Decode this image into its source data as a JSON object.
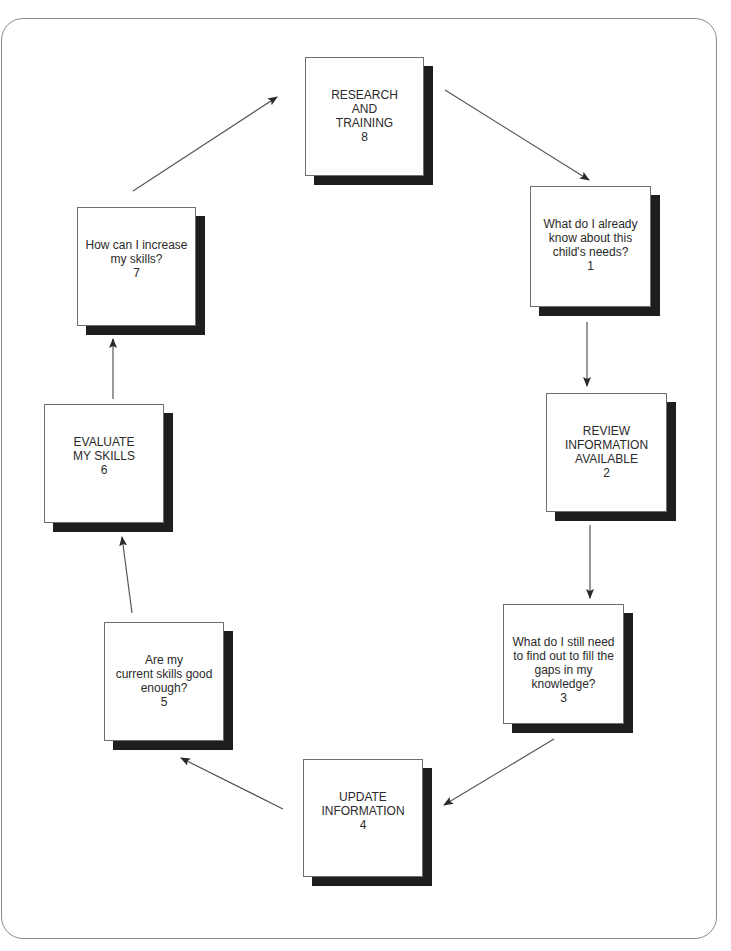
{
  "diagram": {
    "type": "cycle",
    "nodes": [
      {
        "id": 8,
        "lines": [
          "RESEARCH",
          "AND",
          "TRAINING",
          "8"
        ],
        "x": 305,
        "y": 57,
        "w": 119,
        "h": 119
      },
      {
        "id": 1,
        "lines": [
          "What do I already",
          "know about this",
          "child's needs?",
          "1"
        ],
        "x": 530,
        "y": 186,
        "w": 121,
        "h": 121
      },
      {
        "id": 2,
        "lines": [
          "REVIEW",
          "INFORMATION",
          "AVAILABLE",
          "2"
        ],
        "x": 546,
        "y": 393,
        "w": 121,
        "h": 119
      },
      {
        "id": 3,
        "lines": [
          "What do I still need",
          "to find out to fill the",
          "gaps in my",
          "knowledge?",
          "3"
        ],
        "x": 503,
        "y": 604,
        "w": 121,
        "h": 120
      },
      {
        "id": 4,
        "lines": [
          "UPDATE",
          "INFORMATION",
          "4"
        ],
        "x": 303,
        "y": 759,
        "w": 120,
        "h": 118
      },
      {
        "id": 5,
        "lines": [
          "Are my",
          "current skills good",
          "enough?",
          "5"
        ],
        "x": 104,
        "y": 622,
        "w": 120,
        "h": 119
      },
      {
        "id": 6,
        "lines": [
          "EVALUATE",
          "MY SKILLS",
          "6"
        ],
        "x": 44,
        "y": 404,
        "w": 120,
        "h": 119
      },
      {
        "id": 7,
        "lines": [
          "How can I increase",
          "my skills?",
          "7"
        ],
        "x": 77,
        "y": 207,
        "w": 119,
        "h": 119
      }
    ],
    "edges": [
      {
        "from": 8,
        "to": 1,
        "x1": 445,
        "y1": 90,
        "x2": 589,
        "y2": 180
      },
      {
        "from": 1,
        "to": 2,
        "x1": 587,
        "y1": 322,
        "x2": 587,
        "y2": 386
      },
      {
        "from": 2,
        "to": 3,
        "x1": 590,
        "y1": 525,
        "x2": 590,
        "y2": 598
      },
      {
        "from": 3,
        "to": 4,
        "x1": 554,
        "y1": 739,
        "x2": 444,
        "y2": 805
      },
      {
        "from": 4,
        "to": 5,
        "x1": 283,
        "y1": 809,
        "x2": 181,
        "y2": 758
      },
      {
        "from": 5,
        "to": 6,
        "x1": 132,
        "y1": 613,
        "x2": 122,
        "y2": 537
      },
      {
        "from": 6,
        "to": 7,
        "x1": 113,
        "y1": 399,
        "x2": 113,
        "y2": 339
      },
      {
        "from": 7,
        "to": 8,
        "x1": 133,
        "y1": 191,
        "x2": 277,
        "y2": 97
      }
    ],
    "colors": {
      "line": "#555555",
      "shadow": "#1e1e1e",
      "frame": "#8a8a8a"
    }
  }
}
